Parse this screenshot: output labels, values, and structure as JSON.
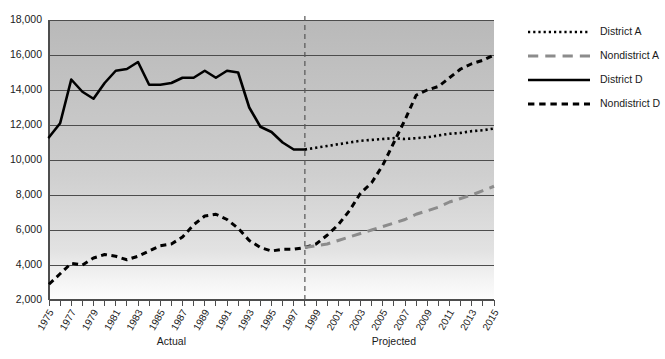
{
  "chart_data": {
    "type": "line",
    "title": "",
    "xlabel": "",
    "ylabel": "",
    "xlim": [
      1975,
      2015
    ],
    "ylim": [
      2000,
      18000
    ],
    "grid": true,
    "legend_position": "right",
    "y_ticks": [
      "18,000",
      "16,000",
      "14,000",
      "12,000",
      "10,000",
      "8,000",
      "6,000",
      "4,000",
      "2,000"
    ],
    "y_tick_values": [
      18000,
      16000,
      14000,
      12000,
      10000,
      8000,
      6000,
      4000,
      2000
    ],
    "x_ticks": [
      "1975",
      "1977",
      "1979",
      "1981",
      "1983",
      "1985",
      "1987",
      "1989",
      "1991",
      "1993",
      "1995",
      "1997",
      "1999",
      "2001",
      "2003",
      "2005",
      "2007",
      "2009",
      "2011",
      "2013",
      "2015"
    ],
    "x_tick_values": [
      1975,
      1977,
      1979,
      1981,
      1983,
      1985,
      1987,
      1989,
      1991,
      1993,
      1995,
      1997,
      1999,
      2001,
      2003,
      2005,
      2007,
      2009,
      2011,
      2013,
      2015
    ],
    "annotations": [
      {
        "name": "actual-section-label",
        "text": "Actual",
        "x": 1986
      },
      {
        "name": "projected-section-label",
        "text": "Projected",
        "x": 2006
      },
      {
        "name": "projection-divider",
        "text": "",
        "x": 1998
      }
    ],
    "series": [
      {
        "name": "District D",
        "style": "solid",
        "color": "#000000",
        "x": [
          1975,
          1976,
          1977,
          1978,
          1979,
          1980,
          1981,
          1982,
          1983,
          1984,
          1985,
          1986,
          1987,
          1988,
          1989,
          1990,
          1991,
          1992,
          1993,
          1994,
          1995,
          1996,
          1997,
          1998
        ],
        "values": [
          11300,
          12100,
          14600,
          13900,
          13500,
          14400,
          15100,
          15200,
          15600,
          14300,
          14300,
          14400,
          14700,
          14700,
          15100,
          14700,
          15100,
          15000,
          13000,
          11900,
          11600,
          11000,
          10600,
          10600
        ]
      },
      {
        "name": "District A",
        "style": "dotted",
        "color": "#000000",
        "x": [
          1998,
          1999,
          2000,
          2001,
          2002,
          2003,
          2004,
          2005,
          2006,
          2007,
          2008,
          2009,
          2010,
          2011,
          2012,
          2013,
          2014,
          2015
        ],
        "values": [
          10600,
          10700,
          10800,
          10900,
          11000,
          11100,
          11150,
          11200,
          11250,
          11200,
          11250,
          11300,
          11400,
          11500,
          11550,
          11650,
          11700,
          11800
        ]
      },
      {
        "name": "Nondistrict D",
        "style": "dashed",
        "color": "#000000",
        "x": [
          1975,
          1976,
          1977,
          1978,
          1979,
          1980,
          1981,
          1982,
          1983,
          1984,
          1985,
          1986,
          1987,
          1988,
          1989,
          1990,
          1991,
          1992,
          1993,
          1994,
          1995,
          1996,
          1997,
          1998,
          1999,
          2000,
          2001,
          2002,
          2003,
          2004,
          2005,
          2006,
          2007,
          2008,
          2009,
          2010,
          2011,
          2012,
          2013,
          2014,
          2015
        ],
        "values": [
          2900,
          3500,
          4100,
          4000,
          4400,
          4600,
          4500,
          4300,
          4500,
          4800,
          5100,
          5200,
          5600,
          6300,
          6800,
          6900,
          6600,
          6100,
          5400,
          5000,
          4800,
          4900,
          4900,
          5000,
          5200,
          5700,
          6300,
          7100,
          8100,
          8700,
          9700,
          11000,
          12300,
          13700,
          14000,
          14200,
          14700,
          15200,
          15500,
          15700,
          16000
        ]
      },
      {
        "name": "Nondistrict A",
        "style": "longdash",
        "color": "#8c8c8c",
        "x": [
          1998,
          1999,
          2000,
          2001,
          2002,
          2003,
          2004,
          2005,
          2006,
          2007,
          2008,
          2009,
          2010,
          2011,
          2012,
          2013,
          2014,
          2015
        ],
        "values": [
          5000,
          5100,
          5200,
          5400,
          5600,
          5800,
          6000,
          6200,
          6400,
          6600,
          6900,
          7100,
          7300,
          7600,
          7800,
          8000,
          8250,
          8500
        ]
      }
    ],
    "legend": [
      {
        "label": "District A",
        "style": "dotted",
        "color": "#000000"
      },
      {
        "label": "Nondistrict A",
        "style": "longdash",
        "color": "#8c8c8c"
      },
      {
        "label": "District D",
        "style": "solid",
        "color": "#000000"
      },
      {
        "label": "Nondistrict D",
        "style": "dashed",
        "color": "#000000"
      }
    ]
  }
}
